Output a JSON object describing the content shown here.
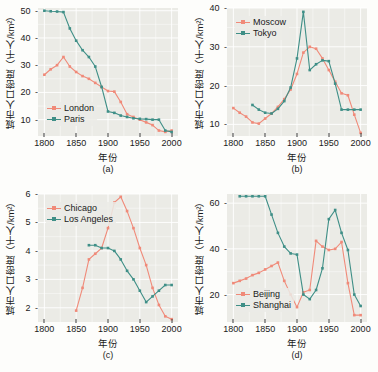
{
  "figure": {
    "background": "#fdfdfb",
    "panel_background": "#ebebe6",
    "grid_color": "#ffffff",
    "colors": {
      "series1": "#f08a79",
      "series2": "#3f8f87"
    },
    "axis_titles": {
      "y": "城市人口密度（千人/km²）",
      "x": "年份"
    }
  },
  "chart_data": [
    {
      "id": "a",
      "type": "line",
      "title": "",
      "caption": "(a)",
      "xlabel": "年份",
      "ylabel": "城市人口密度（千人/km²）",
      "xlim": [
        1790,
        2010
      ],
      "ylim": [
        4,
        51
      ],
      "xticks": [
        1800,
        1850,
        1900,
        1950,
        2000
      ],
      "yticks": [
        10,
        20,
        30,
        40,
        50
      ],
      "grid": true,
      "legend_position": "bottom-left",
      "series": [
        {
          "name": "London",
          "color": "#f08a79",
          "x": [
            1800,
            1810,
            1820,
            1830,
            1840,
            1850,
            1860,
            1870,
            1880,
            1890,
            1900,
            1910,
            1920,
            1930,
            1940,
            1950,
            1960,
            1970,
            1980,
            1990,
            2000
          ],
          "values": [
            26.5,
            28.5,
            30.0,
            33.0,
            29.5,
            27.5,
            26.0,
            25.0,
            23.5,
            22.0,
            20.5,
            20.3,
            16.5,
            12.0,
            11.0,
            10.0,
            9.0,
            8.0,
            6.0,
            5.5,
            6.0
          ]
        },
        {
          "name": "Paris",
          "color": "#3f8f87",
          "x": [
            1800,
            1810,
            1820,
            1830,
            1840,
            1850,
            1860,
            1870,
            1880,
            1890,
            1900,
            1910,
            1920,
            1930,
            1940,
            1950,
            1960,
            1970,
            1980,
            1990,
            2000
          ],
          "values": [
            50.0,
            49.8,
            49.7,
            49.5,
            43.5,
            39.0,
            35.5,
            33.0,
            29.5,
            22.0,
            13.0,
            12.5,
            11.5,
            11.0,
            10.5,
            10.3,
            10.2,
            10.0,
            10.0,
            6.0,
            5.5
          ]
        }
      ]
    },
    {
      "id": "b",
      "type": "line",
      "title": "",
      "caption": "(b)",
      "xlabel": "年份",
      "ylabel": "城市人口密度（千人/km²）",
      "xlim": [
        1790,
        2010
      ],
      "ylim": [
        7,
        40
      ],
      "xticks": [
        1800,
        1850,
        1900,
        1950,
        2000
      ],
      "yticks": [
        10,
        20,
        30,
        40
      ],
      "grid": true,
      "legend_position": "top-left",
      "series": [
        {
          "name": "Moscow",
          "color": "#f08a79",
          "x": [
            1800,
            1810,
            1820,
            1830,
            1840,
            1850,
            1860,
            1870,
            1880,
            1890,
            1900,
            1910,
            1920,
            1930,
            1940,
            1950,
            1960,
            1970,
            1980,
            1990,
            2000
          ],
          "values": [
            14.2,
            13.0,
            12.0,
            10.5,
            10.2,
            11.5,
            12.8,
            14.5,
            16.5,
            19.0,
            23.0,
            28.5,
            30.0,
            29.5,
            27.0,
            24.0,
            21.0,
            18.0,
            17.5,
            12.5,
            7.8
          ]
        },
        {
          "name": "Tokyo",
          "color": "#3f8f87",
          "x": [
            1830,
            1840,
            1850,
            1860,
            1870,
            1880,
            1890,
            1900,
            1910,
            1920,
            1930,
            1940,
            1950,
            1960,
            1970,
            1980,
            1990,
            2000
          ],
          "values": [
            15.0,
            13.8,
            13.0,
            12.8,
            14.0,
            16.0,
            19.5,
            27.0,
            39.0,
            24.0,
            25.5,
            26.5,
            26.3,
            20.5,
            13.8,
            13.8,
            13.8,
            13.8
          ]
        }
      ]
    },
    {
      "id": "c",
      "type": "line",
      "title": "",
      "caption": "(c)",
      "xlabel": "年份",
      "ylabel": "城市人口密度（千人/km²）",
      "xlim": [
        1790,
        2010
      ],
      "ylim": [
        1.5,
        6.0
      ],
      "xticks": [
        1800,
        1850,
        1900,
        1950,
        2000
      ],
      "yticks": [
        2,
        3,
        4,
        5,
        6
      ],
      "grid": true,
      "legend_position": "top-left",
      "series": [
        {
          "name": "Chicago",
          "color": "#f08a79",
          "x": [
            1850,
            1860,
            1870,
            1880,
            1890,
            1900,
            1910,
            1920,
            1930,
            1940,
            1950,
            1960,
            1970,
            1980,
            1990,
            2000
          ],
          "values": [
            1.9,
            2.7,
            3.7,
            3.9,
            4.1,
            4.8,
            5.7,
            5.9,
            5.4,
            4.8,
            4.1,
            3.5,
            2.7,
            2.1,
            1.7,
            1.6
          ]
        },
        {
          "name": "Los Angeles",
          "color": "#3f8f87",
          "x": [
            1870,
            1880,
            1890,
            1900,
            1910,
            1920,
            1930,
            1940,
            1950,
            1960,
            1970,
            1980,
            1990,
            2000
          ],
          "values": [
            4.2,
            4.2,
            4.1,
            4.1,
            4.0,
            3.7,
            3.3,
            3.0,
            2.6,
            2.2,
            2.4,
            2.6,
            2.8,
            2.8
          ]
        }
      ]
    },
    {
      "id": "d",
      "type": "line",
      "title": "",
      "caption": "(d)",
      "xlabel": "年份",
      "ylabel": "城市人口密度（千人/km²）",
      "xlim": [
        1790,
        2010
      ],
      "ylim": [
        8,
        64
      ],
      "xticks": [
        1800,
        1850,
        1900,
        1950,
        2000
      ],
      "yticks": [
        20,
        40,
        60
      ],
      "grid": true,
      "legend_position": "bottom-left",
      "series": [
        {
          "name": "Beijing",
          "color": "#f08a79",
          "x": [
            1800,
            1810,
            1820,
            1830,
            1840,
            1850,
            1860,
            1870,
            1880,
            1890,
            1900,
            1910,
            1920,
            1930,
            1940,
            1950,
            1960,
            1970,
            1980,
            1990,
            2000
          ],
          "values": [
            25.0,
            26.0,
            27.0,
            28.5,
            29.5,
            31.0,
            32.5,
            34.0,
            26.0,
            20.0,
            14.5,
            21.0,
            22.0,
            43.5,
            41.0,
            39.5,
            40.0,
            43.0,
            25.0,
            11.0,
            11.0
          ]
        },
        {
          "name": "Shanghai",
          "color": "#3f8f87",
          "x": [
            1810,
            1820,
            1830,
            1840,
            1850,
            1860,
            1870,
            1880,
            1890,
            1900,
            1910,
            1920,
            1930,
            1940,
            1950,
            1960,
            1970,
            1980,
            1990,
            2000
          ],
          "values": [
            63.0,
            63.0,
            63.0,
            63.0,
            63.0,
            55.0,
            47.0,
            41.0,
            38.0,
            37.5,
            20.0,
            18.0,
            22.0,
            31.5,
            53.0,
            57.0,
            47.0,
            39.5,
            20.0,
            15.0,
            12.0
          ]
        }
      ]
    }
  ]
}
